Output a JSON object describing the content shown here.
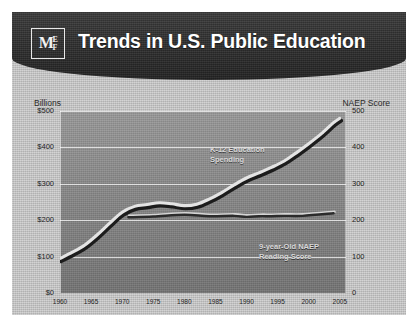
{
  "header": {
    "title": "Trends in U.S. Public Education",
    "logo_primary": "M",
    "logo_secondary_top": "E",
    "logo_secondary_bottom": "F",
    "background_color": "#2c2c2c",
    "title_color": "#ffffff"
  },
  "source_note": "SOURCE: NAEP Long Term Trend Assessment, 2005 & CES, 2005",
  "chart_data": {
    "type": "line",
    "title": "Trends in U.S. Public Education",
    "xlabel": "",
    "ylabel": "Billions",
    "y2label": "NAEP Score",
    "xlim": [
      1960,
      2006
    ],
    "ylim": [
      0,
      500
    ],
    "y2lim": [
      0,
      500
    ],
    "grid": true,
    "legend": "inline-annotations",
    "x_ticks": [
      "1960",
      "1965",
      "1970",
      "1975",
      "1980",
      "1985",
      "1990",
      "1995",
      "2000",
      "2005"
    ],
    "x_tick_values": [
      1960,
      1965,
      1970,
      1975,
      1980,
      1985,
      1990,
      1995,
      2000,
      2005
    ],
    "y_ticks_left": [
      "$0",
      "$100",
      "$200",
      "$300",
      "$400",
      "$500"
    ],
    "y_tick_values_left": [
      0,
      100,
      200,
      300,
      400,
      500
    ],
    "y_ticks_right": [
      "0",
      "100",
      "200",
      "300",
      "400",
      "500"
    ],
    "y_tick_values_right": [
      0,
      100,
      200,
      300,
      400,
      500
    ],
    "series": [
      {
        "name": "K-12 Education Spending",
        "annotation_line1": "K-12 Education",
        "annotation_line2": "Spending",
        "axis": "left",
        "units": "Billions of dollars",
        "color": "#e4e4e4",
        "shadow_color": "#1c1c1c",
        "x": [
          1960,
          1962,
          1964,
          1966,
          1968,
          1970,
          1972,
          1974,
          1976,
          1978,
          1980,
          1982,
          1984,
          1986,
          1988,
          1990,
          1992,
          1994,
          1996,
          1998,
          2000,
          2002,
          2004,
          2005
        ],
        "values": [
          95,
          112,
          132,
          160,
          192,
          222,
          238,
          243,
          248,
          245,
          240,
          244,
          258,
          276,
          297,
          316,
          330,
          345,
          362,
          385,
          410,
          437,
          468,
          480
        ]
      },
      {
        "name": "9-year-Old NAEP Reading Score",
        "annotation_line1": "9-year-Old NAEP",
        "annotation_line2": "Reading Score",
        "axis": "right",
        "units": "NAEP scale score",
        "color": "#2b2b2b",
        "x": [
          1971,
          1975,
          1980,
          1984,
          1988,
          1990,
          1992,
          1994,
          1996,
          1999,
          2004
        ],
        "values": [
          208,
          210,
          215,
          211,
          212,
          209,
          211,
          211,
          212,
          212,
          219
        ]
      }
    ]
  }
}
